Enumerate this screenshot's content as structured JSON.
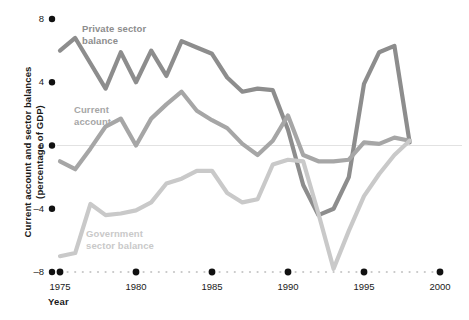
{
  "chart_data": {
    "type": "line",
    "title": "",
    "xlabel": "Year",
    "ylabel": "Current account and sector balances (percentage of GDP)",
    "ylabel_line1": "Current account and sector balances",
    "ylabel_line2": "(percentage of GDP)",
    "xlim": [
      1975,
      2000
    ],
    "ylim": [
      -8,
      8
    ],
    "yticks": [
      8,
      4,
      0,
      -4,
      -8
    ],
    "ytick_labels": [
      "8",
      "4",
      "0",
      "–4",
      "–8"
    ],
    "xticks": [
      1975,
      1980,
      1985,
      1990,
      1995,
      2000
    ],
    "xtick_labels": [
      "1975",
      "1980",
      "1985",
      "1990",
      "1995",
      "2000"
    ],
    "grid": false,
    "zero_line": true,
    "legend_position": "inline-annotations",
    "x": [
      1975,
      1976,
      1977,
      1978,
      1979,
      1980,
      1981,
      1982,
      1983,
      1984,
      1985,
      1986,
      1987,
      1988,
      1989,
      1990,
      1991,
      1992,
      1993,
      1994,
      1995,
      1996,
      1997,
      1998
    ],
    "series": [
      {
        "name": "Private sector balance",
        "label_line1": "Private sector",
        "label_line2": "balance",
        "color": "#8d8d8d",
        "label_color": "#8d8d8d",
        "label_x": 82,
        "label_y": 23,
        "values": [
          6.0,
          6.8,
          5.2,
          3.6,
          5.9,
          4.0,
          6.0,
          4.4,
          6.6,
          6.2,
          5.8,
          4.3,
          3.4,
          3.6,
          3.5,
          1.0,
          -2.5,
          -4.4,
          -4.0,
          -2.0,
          3.9,
          5.9,
          6.3,
          0.2
        ]
      },
      {
        "name": "Current account",
        "label_line1": "Current",
        "label_line2": "account",
        "color": "#a6a6a6",
        "label_color": "#a6a6a6",
        "label_x": 74,
        "label_y": 104,
        "values": [
          -1.0,
          -1.5,
          -0.2,
          1.2,
          1.7,
          0.0,
          1.7,
          2.6,
          3.4,
          2.2,
          1.6,
          1.1,
          0.1,
          -0.6,
          0.3,
          1.9,
          -0.6,
          -1.0,
          -1.0,
          -0.9,
          0.2,
          0.1,
          0.5,
          0.3
        ]
      },
      {
        "name": "Government sector balance",
        "label_line1": "Government",
        "label_line2": "sector balance",
        "color": "#c9c9c9",
        "label_color": "#c9c9c9",
        "label_x": 86,
        "label_y": 228,
        "values": [
          -7.0,
          -6.8,
          -3.7,
          -4.4,
          -4.3,
          -4.1,
          -3.6,
          -2.4,
          -2.1,
          -1.6,
          -1.6,
          -3.0,
          -3.6,
          -3.4,
          -1.2,
          -0.9,
          -1.0,
          -4.3,
          -7.8,
          -5.4,
          -3.2,
          -1.8,
          -0.6,
          0.3
        ]
      }
    ]
  },
  "axes": {
    "x_axis_dotted": true,
    "x_axis_dot_color": "#c6c6c6",
    "x_tick_marker_color": "#111111",
    "zero_line_color": "#e2e2e2"
  }
}
